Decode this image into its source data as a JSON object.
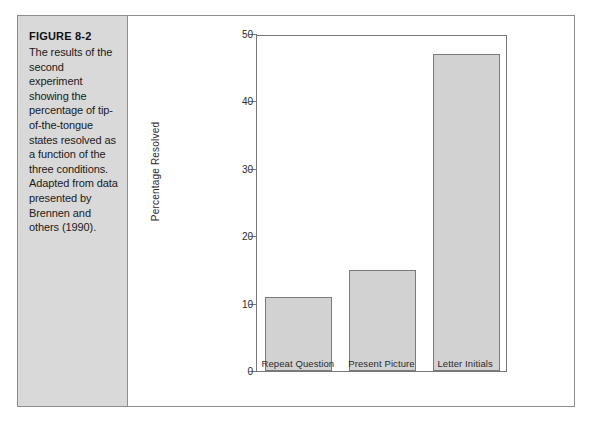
{
  "figure": {
    "caption_title": "FIGURE 8-2",
    "caption_body": "The results of the second experiment showing the percentage of tip-of-the-tongue states resolved as a function of the three conditions. Adapted from data presented by Brennen and others (1990)."
  },
  "colors": {
    "bar_fill": "#d2d2d2",
    "bar_stroke": "#7a7a7a",
    "panel_background": "#d9d9d9",
    "frame_border": "#8d8d8d",
    "axis": "#777777",
    "text": "#1a1a1a"
  },
  "chart_data": {
    "type": "bar",
    "title": "",
    "xlabel": "",
    "ylabel": "Percentage Resolved",
    "categories": [
      "Repeat Question",
      "Present Picture",
      "Letter Initials"
    ],
    "values": [
      11,
      15,
      47
    ],
    "ylim": [
      0,
      50
    ],
    "yticks": [
      0,
      10,
      20,
      30,
      40,
      50
    ],
    "ytick_labels": [
      "0",
      "10",
      "20",
      "30",
      "40",
      "50"
    ],
    "grid": false,
    "legend": "none"
  }
}
